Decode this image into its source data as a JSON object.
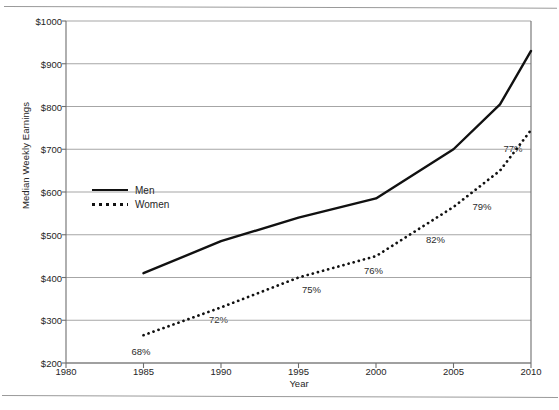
{
  "chart_data": {
    "type": "line",
    "title": "",
    "xlabel": "Year",
    "ylabel": "Median Weekly Earnings",
    "xlim": [
      1980,
      2010
    ],
    "ylim": [
      200,
      1000
    ],
    "xticks": [
      "1980",
      "1985",
      "1990",
      "1995",
      "2000",
      "2005",
      "2010"
    ],
    "yticks": [
      "$1000",
      "$900",
      "$800",
      "$700",
      "$600",
      "$500",
      "$400",
      "$300",
      "$200"
    ],
    "grid": "horizontal",
    "legend_position": "inside-left",
    "x": [
      1985,
      1990,
      1995,
      2000,
      2005,
      2008,
      2010
    ],
    "series": [
      {
        "name": "Men",
        "style": "solid",
        "values": [
          410,
          485,
          540,
          585,
          700,
          805,
          930
        ]
      },
      {
        "name": "Women",
        "style": "dotted",
        "values": [
          265,
          330,
          400,
          450,
          565,
          650,
          745
        ]
      }
    ],
    "annotations": [
      {
        "text": "68%",
        "x": 1985,
        "y": 225
      },
      {
        "text": "72%",
        "x": 1990,
        "y": 300
      },
      {
        "text": "75%",
        "x": 1996,
        "y": 370
      },
      {
        "text": "76%",
        "x": 2000,
        "y": 415
      },
      {
        "text": "82%",
        "x": 2004,
        "y": 487
      },
      {
        "text": "79%",
        "x": 2007,
        "y": 565
      },
      {
        "text": "77%",
        "x": 2009,
        "y": 700
      }
    ]
  },
  "axis": {
    "y_label": "Median Weekly Earnings",
    "x_label": "Year",
    "y_ticks": [
      {
        "label": "$1000",
        "value": 1000
      },
      {
        "label": "$900",
        "value": 900
      },
      {
        "label": "$800",
        "value": 800
      },
      {
        "label": "$700",
        "value": 700
      },
      {
        "label": "$600",
        "value": 600
      },
      {
        "label": "$500",
        "value": 500
      },
      {
        "label": "$400",
        "value": 400
      },
      {
        "label": "$300",
        "value": 300
      },
      {
        "label": "$200",
        "value": 200
      }
    ],
    "x_ticks": [
      {
        "label": "1980",
        "value": 1980
      },
      {
        "label": "1985",
        "value": 1985
      },
      {
        "label": "1990",
        "value": 1990
      },
      {
        "label": "1995",
        "value": 1995
      },
      {
        "label": "2000",
        "value": 2000
      },
      {
        "label": "2005",
        "value": 2005
      },
      {
        "label": "2010",
        "value": 2010
      }
    ]
  },
  "legend": {
    "items": [
      {
        "label": "Men",
        "style": "solid"
      },
      {
        "label": "Women",
        "style": "dotted"
      }
    ]
  },
  "colors": {
    "line": "#111111",
    "grid": "#a6a6a6",
    "axis": "#6e6e6e",
    "text": "#262626",
    "background": "#ffffff"
  }
}
